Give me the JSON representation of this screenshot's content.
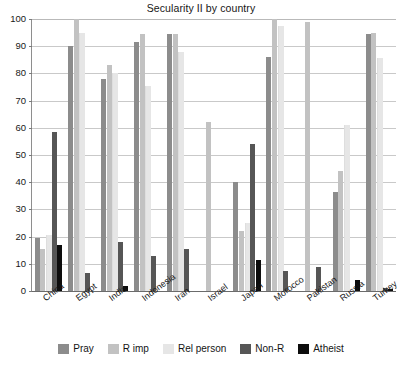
{
  "chart_data": {
    "type": "bar",
    "title": "Secularity II by country",
    "xlabel": "",
    "ylabel": "",
    "ylim": [
      0,
      100
    ],
    "yticks": [
      0,
      10,
      20,
      30,
      40,
      50,
      60,
      70,
      80,
      90,
      100
    ],
    "grid": true,
    "legend_position": "bottom",
    "categories": [
      "China",
      "Egypt",
      "India",
      "Indonesia",
      "Iran",
      "Israel",
      "Japan",
      "Morocco",
      "Pakistan",
      "Russia",
      "Turkey"
    ],
    "series": [
      {
        "name": "Pray",
        "color": "#8c8c8c",
        "values": [
          19.5,
          90,
          78,
          91.5,
          94.5,
          0,
          40,
          86,
          0,
          36.5,
          94.5
        ]
      },
      {
        "name": "R imp",
        "color": "#c2c2c2",
        "values": [
          15.5,
          100,
          83,
          94.5,
          94.5,
          62,
          22,
          100,
          99,
          44,
          95
        ]
      },
      {
        "name": "Rel person",
        "color": "#e6e6e6",
        "values": [
          20.5,
          95,
          80,
          75.5,
          88,
          0,
          25,
          97.5,
          0,
          61,
          85.5
        ]
      },
      {
        "name": "Non-R",
        "color": "#565656",
        "values": [
          58.5,
          6.5,
          18,
          13,
          15.5,
          0,
          54,
          7.5,
          9,
          0,
          1
        ]
      },
      {
        "name": "Atheist",
        "color": "#0d0d0d",
        "values": [
          17,
          0,
          2,
          0,
          0,
          0,
          11.5,
          0,
          0,
          4,
          0.8
        ]
      }
    ]
  }
}
